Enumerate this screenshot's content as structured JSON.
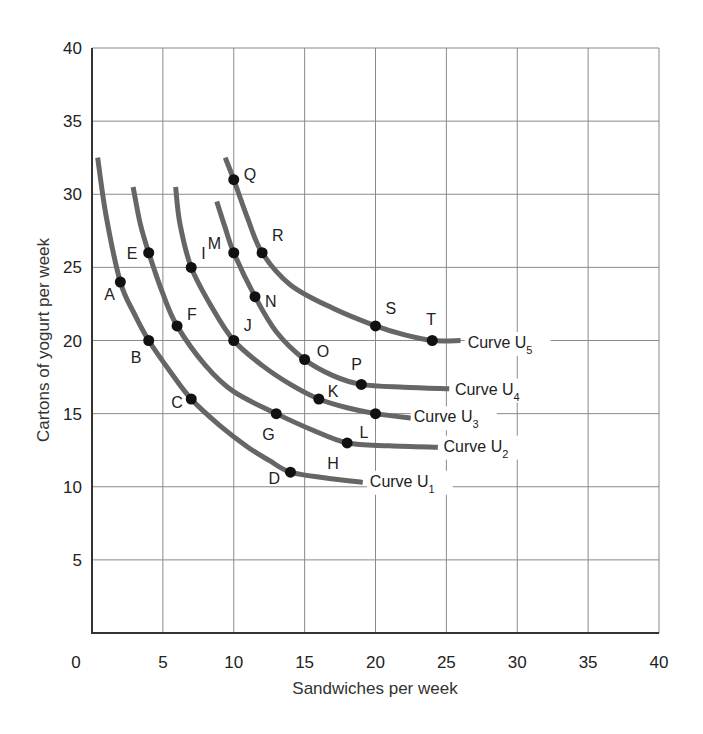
{
  "chart_data": {
    "type": "line",
    "title": "",
    "xlabel": "Sandwiches per week",
    "ylabel": "Cartons of yogurt per week",
    "xlim": [
      0,
      40
    ],
    "ylim": [
      0,
      40
    ],
    "xticks": [
      0,
      5,
      10,
      15,
      20,
      25,
      30,
      35,
      40
    ],
    "yticks": [
      5,
      10,
      15,
      20,
      25,
      30,
      35,
      40
    ],
    "y_zero_label": "0",
    "grid": true,
    "legend": "inline curve labels at right end of each curve",
    "series": [
      {
        "name": "Curve U1",
        "label_main": "Curve U",
        "label_sub": "1",
        "label_pos": [
          19.6,
          10.0
        ],
        "path": [
          [
            0.4,
            32.5
          ],
          [
            1.0,
            28.5
          ],
          [
            2,
            24
          ],
          [
            3,
            21.8
          ],
          [
            4,
            20
          ],
          [
            5.5,
            17.9
          ],
          [
            7,
            16
          ],
          [
            9,
            14.2
          ],
          [
            11,
            12.7
          ],
          [
            12.5,
            11.8
          ],
          [
            14,
            11
          ],
          [
            16.5,
            10.6
          ],
          [
            19.1,
            10.3
          ]
        ],
        "points": [
          {
            "label": "A",
            "x": 2,
            "y": 24,
            "label_dx": -16,
            "label_dy": 18
          },
          {
            "label": "B",
            "x": 4,
            "y": 20,
            "label_dx": -18,
            "label_dy": 22
          },
          {
            "label": "C",
            "x": 7,
            "y": 16,
            "label_dx": -20,
            "label_dy": 9
          },
          {
            "label": "D",
            "x": 14,
            "y": 11,
            "label_dx": -22,
            "label_dy": 12
          }
        ]
      },
      {
        "name": "Curve U2",
        "label_main": "Curve U",
        "label_sub": "2",
        "label_pos": [
          24.8,
          12.4
        ],
        "path": [
          [
            2.9,
            30.5
          ],
          [
            3.4,
            28
          ],
          [
            4,
            26
          ],
          [
            5,
            23.2
          ],
          [
            6,
            21
          ],
          [
            8,
            18.3
          ],
          [
            10,
            16.5
          ],
          [
            13,
            15
          ],
          [
            15.5,
            13.9
          ],
          [
            18,
            13
          ],
          [
            21,
            12.8
          ],
          [
            24.4,
            12.7
          ]
        ],
        "points": [
          {
            "label": "E",
            "x": 4,
            "y": 26,
            "label_dx": -22,
            "label_dy": 6
          },
          {
            "label": "F",
            "x": 6,
            "y": 21,
            "label_dx": 10,
            "label_dy": -6
          },
          {
            "label": "G",
            "x": 13,
            "y": 15,
            "label_dx": -14,
            "label_dy": 26
          },
          {
            "label": "H",
            "x": 18,
            "y": 13,
            "label_dx": -20,
            "label_dy": 26
          }
        ]
      },
      {
        "name": "Curve U3",
        "label_main": "Curve U",
        "label_sub": "3",
        "label_pos": [
          22.7,
          14.4
        ],
        "path": [
          [
            5.9,
            30.5
          ],
          [
            6.2,
            28
          ],
          [
            7,
            25
          ],
          [
            8.5,
            22.2
          ],
          [
            10,
            20
          ],
          [
            12,
            18.3
          ],
          [
            14,
            17
          ],
          [
            16,
            16
          ],
          [
            18,
            15.4
          ],
          [
            20,
            15
          ],
          [
            22.5,
            14.7
          ]
        ],
        "points": [
          {
            "label": "I",
            "x": 7,
            "y": 25,
            "label_dx": 10,
            "label_dy": -8
          },
          {
            "label": "J",
            "x": 10,
            "y": 20,
            "label_dx": 10,
            "label_dy": -10
          },
          {
            "label": "K",
            "x": 16,
            "y": 16,
            "label_dx": 9,
            "label_dy": -2
          },
          {
            "label": "L",
            "x": 20,
            "y": 15,
            "label_dx": -16,
            "label_dy": 24
          }
        ]
      },
      {
        "name": "Curve U4",
        "label_main": "Curve U",
        "label_sub": "4",
        "label_pos": [
          25.6,
          16.3
        ],
        "path": [
          [
            8.8,
            29.5
          ],
          [
            9.4,
            27.7
          ],
          [
            10,
            26
          ],
          [
            11.5,
            23
          ],
          [
            13,
            20.6
          ],
          [
            15,
            18.7
          ],
          [
            17,
            17.6
          ],
          [
            19,
            17
          ],
          [
            22,
            16.8
          ],
          [
            25.2,
            16.7
          ]
        ],
        "points": [
          {
            "label": "M",
            "x": 10,
            "y": 26,
            "label_dx": -26,
            "label_dy": -4
          },
          {
            "label": "N",
            "x": 11.5,
            "y": 23,
            "label_dx": 10,
            "label_dy": 10
          },
          {
            "label": "O",
            "x": 15,
            "y": 18.7,
            "label_dx": 12,
            "label_dy": -3
          },
          {
            "label": "P",
            "x": 19,
            "y": 17,
            "label_dx": -10,
            "label_dy": -14
          }
        ]
      },
      {
        "name": "Curve U5",
        "label_main": "Curve U",
        "label_sub": "5",
        "label_pos": [
          26.5,
          19.5
        ],
        "path": [
          [
            9.4,
            32.5
          ],
          [
            10,
            31
          ],
          [
            11,
            28.3
          ],
          [
            12,
            26
          ],
          [
            14,
            23.8
          ],
          [
            17,
            22.2
          ],
          [
            20,
            21
          ],
          [
            22,
            20.4
          ],
          [
            24,
            20
          ],
          [
            26,
            20
          ]
        ],
        "points": [
          {
            "label": "Q",
            "x": 10,
            "y": 31,
            "label_dx": 10,
            "label_dy": 0
          },
          {
            "label": "R",
            "x": 12,
            "y": 26,
            "label_dx": 10,
            "label_dy": -12
          },
          {
            "label": "S",
            "x": 20,
            "y": 21,
            "label_dx": 10,
            "label_dy": -12
          },
          {
            "label": "T",
            "x": 24,
            "y": 20,
            "label_dx": -6,
            "label_dy": -16
          }
        ]
      }
    ]
  },
  "layout": {
    "plot_left": 92,
    "plot_right": 659,
    "plot_top": 48,
    "plot_bottom": 633
  },
  "colors": {
    "curve": "#666666",
    "dot": "#111111",
    "grid": "#8a8a8a",
    "frame": "#333333"
  }
}
